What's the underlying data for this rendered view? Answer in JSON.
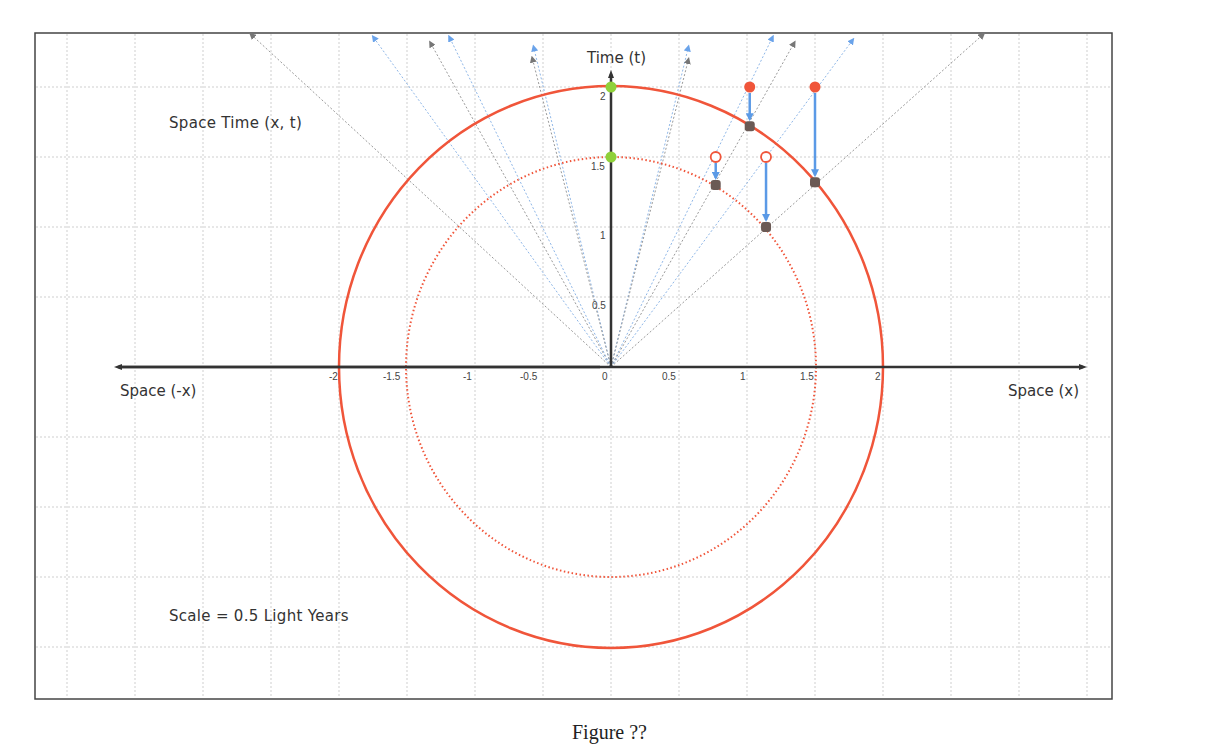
{
  "figure": {
    "title": "Space Time  (x, t)",
    "scale_note": "Scale = 0.5 Light Years",
    "caption": "Figure ??"
  },
  "axes": {
    "x_positive_label": "Space (x)",
    "x_negative_label": "Space (-x)",
    "y_label": "Time (t)",
    "x_ticks": [
      "-2",
      "-1.5",
      "-1",
      "-0.5",
      "0",
      "0.5",
      "1",
      "1.5",
      "2"
    ],
    "y_ticks": [
      "0.5",
      "1",
      "1.5",
      "2"
    ]
  },
  "colors": {
    "circle": "#f0553a",
    "green_point": "#8fd13a",
    "red_point": "#f0553a",
    "grey_point": "#6b5a55",
    "blue_arrow": "#5b9ae6",
    "grid": "#c8c8c8",
    "axis": "#333333",
    "fan_blue": "#8fb7e8",
    "fan_grey": "#9a9a9a"
  },
  "chart_data": {
    "type": "scatter",
    "title": "Space Time (x, t)",
    "xlabel": "Space (x)",
    "ylabel": "Time (t)",
    "xlim": [
      -4.0,
      3.5
    ],
    "ylim": [
      -2.3,
      2.4
    ],
    "grid": true,
    "annotations": [
      "Space Time  (x, t)",
      "Scale = 0.5 Light Years",
      "Space (-x)",
      "Space (x)",
      "Time (t)"
    ],
    "circles": [
      {
        "name": "outer circle",
        "radius": 2.0,
        "style": "solid",
        "color": "#f0553a"
      },
      {
        "name": "inner circle",
        "radius": 1.5,
        "style": "dotted",
        "color": "#f0553a"
      }
    ],
    "series": [
      {
        "name": "green points (on t-axis)",
        "points": [
          [
            0,
            2.0
          ],
          [
            0,
            1.5
          ]
        ]
      },
      {
        "name": "red filled points",
        "points": [
          [
            1.02,
            2.0
          ],
          [
            1.5,
            2.0
          ]
        ]
      },
      {
        "name": "red hollow points",
        "points": [
          [
            0.77,
            1.5
          ],
          [
            1.14,
            1.5
          ]
        ]
      },
      {
        "name": "grey projected points (outer)",
        "points": [
          [
            1.02,
            1.72
          ],
          [
            1.5,
            1.32
          ]
        ]
      },
      {
        "name": "grey projected points (inner)",
        "points": [
          [
            0.77,
            1.3
          ],
          [
            1.14,
            1.0
          ]
        ]
      }
    ],
    "projection_arrows": [
      {
        "from": [
          1.02,
          2.0
        ],
        "to": [
          1.02,
          1.72
        ]
      },
      {
        "from": [
          1.5,
          2.0
        ],
        "to": [
          1.5,
          1.32
        ]
      },
      {
        "from": [
          0.77,
          1.5
        ],
        "to": [
          0.77,
          1.3
        ]
      },
      {
        "from": [
          1.14,
          1.5
        ],
        "to": [
          1.14,
          1.0
        ]
      }
    ],
    "worldlines_from_origin": [
      {
        "to": [
          -2.65,
          2.4
        ],
        "color": "grey"
      },
      {
        "to": [
          -1.75,
          2.36
        ],
        "color": "blue"
      },
      {
        "to": [
          -1.33,
          2.32
        ],
        "color": "grey"
      },
      {
        "to": [
          -1.19,
          2.36
        ],
        "color": "blue"
      },
      {
        "to": [
          -0.57,
          2.29
        ],
        "color": "blue"
      },
      {
        "to": [
          -0.58,
          2.21
        ],
        "color": "grey"
      },
      {
        "to": [
          0.57,
          2.29
        ],
        "color": "blue"
      },
      {
        "to": [
          0.57,
          2.2
        ],
        "color": "grey"
      },
      {
        "to": [
          1.19,
          2.36
        ],
        "color": "blue"
      },
      {
        "to": [
          1.35,
          2.32
        ],
        "color": "grey"
      },
      {
        "to": [
          1.78,
          2.34
        ],
        "color": "blue"
      },
      {
        "to": [
          2.74,
          2.38
        ],
        "color": "grey"
      }
    ]
  }
}
